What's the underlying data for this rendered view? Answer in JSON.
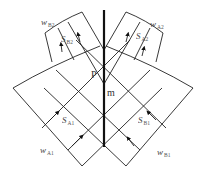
{
  "diagram": {
    "axis_label_p": "P",
    "axis_label_m": "m",
    "labels": {
      "wB2": {
        "main": "w",
        "sub": "B2"
      },
      "SB2": {
        "main": "S",
        "sub": "B2"
      },
      "wA2": {
        "main": "w",
        "sub": "A2"
      },
      "SA2": {
        "main": "S",
        "sub": "A2"
      },
      "SA1": {
        "main": "S",
        "sub": "A1"
      },
      "wA1": {
        "main": "w",
        "sub": "A1"
      },
      "SB1": {
        "main": "S",
        "sub": "B1"
      },
      "wB1": {
        "main": "w",
        "sub": "B1"
      }
    },
    "colors": {
      "line": "#222222",
      "axis": "#111111",
      "background": "#ffffff"
    }
  }
}
